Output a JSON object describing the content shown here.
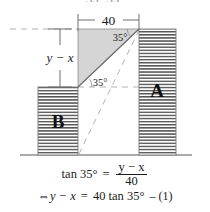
{
  "figure": {
    "title_semantic": "right-triangle-trigonometry-diagram",
    "top_dimension": {
      "label": "40"
    },
    "vertical_dimension": {
      "label": "y − x"
    },
    "angles": [
      {
        "id": "upper",
        "label": "35°"
      },
      {
        "id": "lower",
        "label": "35°"
      }
    ],
    "columns": [
      {
        "id": "B",
        "label": "B"
      },
      {
        "id": "A",
        "label": "A"
      }
    ],
    "colors": {
      "shaded_fill": "#d4d4d4",
      "hatch_line": "#4a4a4a",
      "outline": "#6f6f6f",
      "dashed": "#b0b0b0",
      "ground": "#909090",
      "text": "#1b1b1b"
    }
  },
  "equations": {
    "line1": {
      "lhs": "tan 35°",
      "relation": "=",
      "numerator": "y − x",
      "denominator": "40"
    },
    "line2": {
      "arrow": "⇔",
      "lhs": "y − x",
      "relation": "=",
      "rhs": "40 tan 35°",
      "number": "– (1)"
    }
  },
  "top_cut_text": "35°      35°"
}
